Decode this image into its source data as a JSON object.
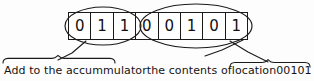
{
  "figure": {
    "background_color": "#fdfdfd",
    "ink_color": "#1a1a1a"
  },
  "instruction_word": {
    "label": "8-bit instruction word",
    "bits": [
      "0",
      "1",
      "1",
      "0",
      "0",
      "1",
      "0",
      "1"
    ],
    "opcode": {
      "label": "opcode",
      "bits": [
        "0",
        "1",
        "1"
      ],
      "value": "011"
    },
    "operand": {
      "label": "operand address",
      "bits": [
        "0",
        "0",
        "1",
        "0",
        "1"
      ],
      "value": "00101"
    }
  },
  "annotations": {
    "opcode_text": "Add to the accummulator",
    "middle_text": "the contents of",
    "operand_word": "location",
    "operand_value": "00101",
    "full_caption": "Add to the accummulator the contents of location 00101"
  },
  "markers": {
    "left_brace": "left-curly-brace",
    "right_brace": "right-curly-brace",
    "opcode_ellipse": "ellipse-highlight",
    "operand_ellipse": "ellipse-highlight",
    "opcode_leader": "leader-line",
    "operand_leader": "leader-line"
  }
}
